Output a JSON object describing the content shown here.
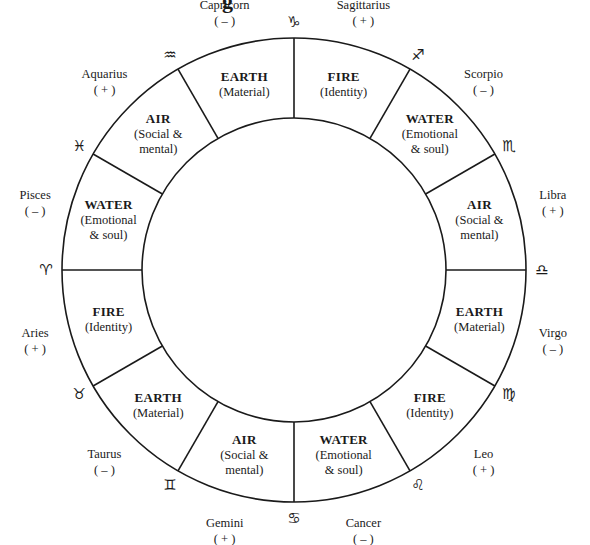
{
  "diagram": {
    "center": [
      294,
      270
    ],
    "outer_radius": 232,
    "inner_radius": 152,
    "line_color": "#1a1a1a",
    "title_fragment": "g",
    "segments": [
      {
        "sign": "Capricorn",
        "polarity": "( – )",
        "element": "EARTH",
        "desc_lines": [
          "(Material)"
        ],
        "glyph": "♑",
        "glyph_name": "capricorn-glyph-icon",
        "start_angle": 90
      },
      {
        "sign": "Aquarius",
        "polarity": "( + )",
        "element": "AIR",
        "desc_lines": [
          "(Social &",
          "mental)"
        ],
        "glyph": "♒",
        "glyph_name": "aquarius-glyph-icon",
        "start_angle": 120
      },
      {
        "sign": "Pisces",
        "polarity": "( – )",
        "element": "WATER",
        "desc_lines": [
          "(Emotional",
          "& soul)"
        ],
        "glyph": "♓",
        "glyph_name": "pisces-glyph-icon",
        "start_angle": 150
      },
      {
        "sign": "Aries",
        "polarity": "( + )",
        "element": "FIRE",
        "desc_lines": [
          "(Identity)"
        ],
        "glyph": "♈",
        "glyph_name": "aries-glyph-icon",
        "start_angle": 180
      },
      {
        "sign": "Taurus",
        "polarity": "( – )",
        "element": "EARTH",
        "desc_lines": [
          "(Material)"
        ],
        "glyph": "♉",
        "glyph_name": "taurus-glyph-icon",
        "start_angle": 210
      },
      {
        "sign": "Gemini",
        "polarity": "( + )",
        "element": "AIR",
        "desc_lines": [
          "(Social &",
          "mental)"
        ],
        "glyph": "♊",
        "glyph_name": "gemini-glyph-icon",
        "start_angle": 240
      },
      {
        "sign": "Cancer",
        "polarity": "( – )",
        "element": "WATER",
        "desc_lines": [
          "(Emotional",
          "& soul)"
        ],
        "glyph": "♋",
        "glyph_name": "cancer-glyph-icon",
        "start_angle": 270
      },
      {
        "sign": "Leo",
        "polarity": "( + )",
        "element": "FIRE",
        "desc_lines": [
          "(Identity)"
        ],
        "glyph": "♌",
        "glyph_name": "leo-glyph-icon",
        "start_angle": 300
      },
      {
        "sign": "Virgo",
        "polarity": "( – )",
        "element": "EARTH",
        "desc_lines": [
          "(Material)"
        ],
        "glyph": "♍",
        "glyph_name": "virgo-glyph-icon",
        "start_angle": 330
      },
      {
        "sign": "Libra",
        "polarity": "( + )",
        "element": "AIR",
        "desc_lines": [
          "(Social &",
          "mental)"
        ],
        "glyph": "♎",
        "glyph_name": "libra-glyph-icon",
        "start_angle": 0
      },
      {
        "sign": "Scorpio",
        "polarity": "( – )",
        "element": "WATER",
        "desc_lines": [
          "(Emotional",
          "& soul)"
        ],
        "glyph": "♏",
        "glyph_name": "scorpio-glyph-icon",
        "start_angle": 30
      },
      {
        "sign": "Sagittarius",
        "polarity": "( + )",
        "element": "FIRE",
        "desc_lines": [
          "(Identity)"
        ],
        "glyph": "♐",
        "glyph_name": "sagittarius-glyph-icon",
        "start_angle": 60
      }
    ]
  }
}
